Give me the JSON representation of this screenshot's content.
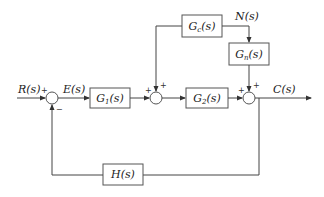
{
  "diagram": {
    "type": "control-system-block-diagram",
    "signals": {
      "input": "R(s)",
      "error": "E(s)",
      "disturbance": "N(s)",
      "output": "C(s)"
    },
    "blocks": {
      "g1": {
        "base": "G",
        "sub": "1",
        "tail": "(s)"
      },
      "g2": {
        "base": "G",
        "sub": "2",
        "tail": "(s)"
      },
      "gc": {
        "base": "G",
        "sub": "c",
        "tail": "(s)"
      },
      "gn": {
        "base": "G",
        "sub": "n",
        "tail": "(s)"
      },
      "h": {
        "label": "H(s)"
      }
    },
    "summing_junctions": {
      "sum1": {
        "in_left": "+",
        "in_bottom": "−"
      },
      "sum2": {
        "in_left": "+",
        "in_top": "+"
      },
      "sum3": {
        "in_left": "+",
        "in_top": "+"
      }
    },
    "colors": {
      "line": "#444444",
      "text": "#222222",
      "background": "#ffffff"
    }
  }
}
